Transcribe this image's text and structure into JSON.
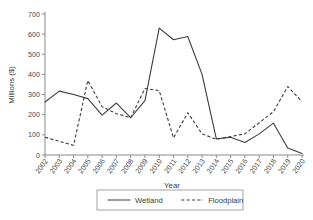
{
  "chart_data": {
    "type": "line",
    "title": "",
    "xlabel": "Year",
    "ylabel": "Millions ($)",
    "categories": [
      "2002",
      "2003",
      "2004",
      "2005",
      "2006",
      "2007",
      "2008",
      "2009",
      "2010",
      "2011",
      "2012",
      "2013",
      "2014",
      "2015",
      "2016",
      "2017",
      "2018",
      "2019",
      "2020"
    ],
    "series": [
      {
        "name": "Wetland",
        "style": "solid",
        "color": "#3d3d3d",
        "values": [
          263,
          317,
          300,
          280,
          198,
          258,
          185,
          270,
          630,
          572,
          588,
          400,
          80,
          88,
          62,
          105,
          158,
          35,
          8
        ]
      },
      {
        "name": "Floodplain",
        "style": "dashed",
        "color": "#3d3d3d",
        "values": [
          88,
          68,
          48,
          370,
          240,
          205,
          185,
          330,
          320,
          85,
          210,
          105,
          78,
          92,
          105,
          160,
          215,
          340,
          265
        ]
      }
    ],
    "ylim": [
      0,
      700
    ],
    "yticks": [
      0,
      100,
      200,
      300,
      400,
      500,
      600,
      700
    ],
    "grid": false,
    "legend_position": "bottom-center"
  },
  "legend": {
    "items": [
      {
        "label": "Wetland",
        "style": "solid"
      },
      {
        "label": "Floodplain",
        "style": "dashed"
      }
    ]
  },
  "axes": {
    "y_title": "Millions ($)",
    "x_title": "Year"
  }
}
